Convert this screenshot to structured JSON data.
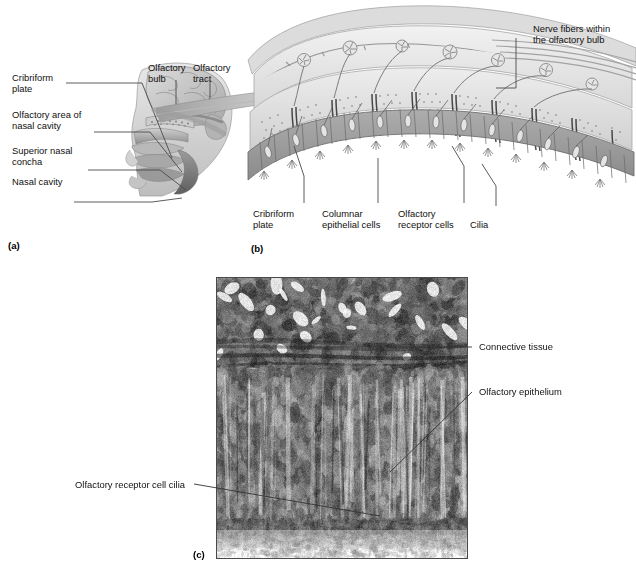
{
  "figure": {
    "panels": [
      {
        "id": "a",
        "id_label": "(a)",
        "name": "sagittal-head-section",
        "labels": [
          {
            "key": "cribriform_plate",
            "text": "Cribriform\nplate"
          },
          {
            "key": "olfactory_area",
            "text": "Olfactory area of\nnasal cavity"
          },
          {
            "key": "superior_nasal_concha",
            "text": "Superior nasal\nconcha"
          },
          {
            "key": "nasal_cavity",
            "text": "Nasal cavity"
          },
          {
            "key": "olfactory_bulb",
            "text": "Olfactory\nbulb"
          },
          {
            "key": "olfactory_tract",
            "text": "Olfactory\ntract"
          }
        ]
      },
      {
        "id": "b",
        "id_label": "(b)",
        "name": "olfactory-epithelium-diagram",
        "labels": [
          {
            "key": "nerve_fibers",
            "text": "Nerve fibers within\nthe olfactory bulb"
          },
          {
            "key": "cribriform_plate",
            "text": "Cribriform\nplate"
          },
          {
            "key": "columnar_epithelial_cells",
            "text": "Columnar\nepithelial cells"
          },
          {
            "key": "olfactory_receptor_cells",
            "text": "Olfactory\nreceptor cells"
          },
          {
            "key": "cilia",
            "text": "Cilia"
          }
        ]
      },
      {
        "id": "c",
        "id_label": "(c)",
        "name": "light-micrograph",
        "labels": [
          {
            "key": "connective_tissue",
            "text": "Connective tissue"
          },
          {
            "key": "olfactory_epithelium",
            "text": "Olfactory epithelium"
          },
          {
            "key": "olfactory_receptor_cell_cilia",
            "text": "Olfactory receptor cell cilia"
          }
        ]
      }
    ]
  },
  "colors": {
    "background": "#ffffff",
    "text": "#111111",
    "leader_line": "#4a4a4a",
    "tissue_mid": "#9a9a9a",
    "tissue_light": "#d7d7d7",
    "tissue_dark": "#6f6f6f",
    "bone_stipple": "#8d8d8d",
    "micrograph_border": "#4a4a4a"
  }
}
